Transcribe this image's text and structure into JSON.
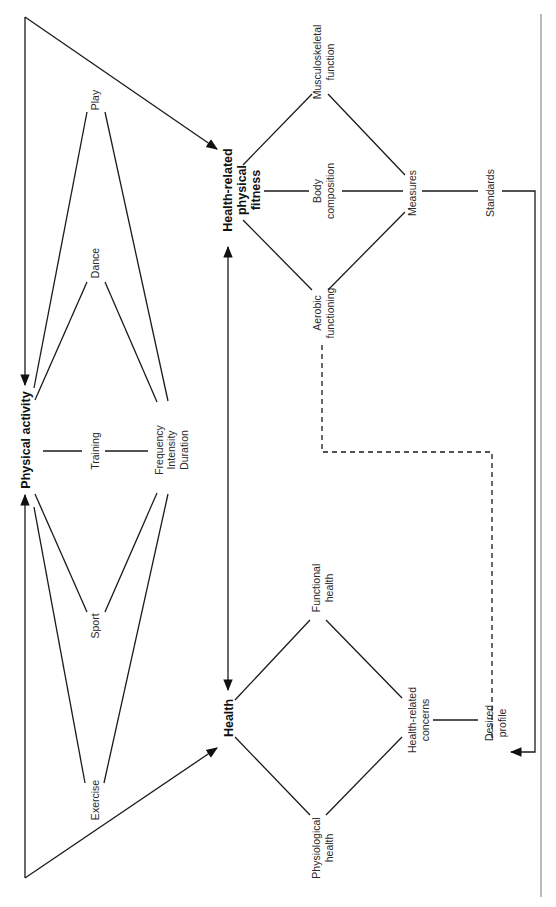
{
  "diagram": {
    "orientation": "rotated-90-ccw",
    "nodes": {
      "physical_activity": "Physical activity",
      "health_fitness": [
        "Health-related",
        "physical",
        "fitness"
      ],
      "health": "Health",
      "play": "Play",
      "dance": "Dance",
      "training": "Training",
      "sport": "Sport",
      "exercise": "Exercise",
      "fid": [
        "Frequency",
        "Intensity",
        "Duration"
      ],
      "musculoskeletal": [
        "Musculoskeletal",
        "function"
      ],
      "body_composition": [
        "Body",
        "composition"
      ],
      "aerobic": [
        "Aerobic",
        "functioning"
      ],
      "measures": "Measures",
      "standards": "Standards",
      "functional_health": [
        "Functional",
        "health"
      ],
      "physiological_health": [
        "Physiological",
        "health"
      ],
      "health_concerns": [
        "Health-related",
        "concerns"
      ],
      "desired_profile": [
        "Desired",
        "profile"
      ]
    },
    "edges": [
      {
        "from": "Physical activity",
        "to": "Health-related physical fitness",
        "type": "arrow"
      },
      {
        "from": "Physical activity",
        "to": "Health",
        "type": "arrow"
      },
      {
        "from": "Health-related physical fitness",
        "to": "Physical activity",
        "type": "arrow"
      },
      {
        "from": "Health",
        "to": "Physical activity",
        "type": "arrow"
      },
      {
        "from": "Health",
        "to": "Health-related physical fitness",
        "type": "double-arrow"
      },
      {
        "from": "Physical activity",
        "to": "Play",
        "type": "line"
      },
      {
        "from": "Physical activity",
        "to": "Dance",
        "type": "line"
      },
      {
        "from": "Physical activity",
        "to": "Training",
        "type": "line"
      },
      {
        "from": "Physical activity",
        "to": "Sport",
        "type": "line"
      },
      {
        "from": "Physical activity",
        "to": "Exercise",
        "type": "line"
      },
      {
        "from": "Frequency/Intensity/Duration",
        "to": "Play",
        "type": "line"
      },
      {
        "from": "Frequency/Intensity/Duration",
        "to": "Dance",
        "type": "line"
      },
      {
        "from": "Frequency/Intensity/Duration",
        "to": "Training",
        "type": "line"
      },
      {
        "from": "Frequency/Intensity/Duration",
        "to": "Sport",
        "type": "line"
      },
      {
        "from": "Frequency/Intensity/Duration",
        "to": "Exercise",
        "type": "line"
      },
      {
        "from": "Health-related physical fitness",
        "to": "Musculoskeletal function",
        "type": "line"
      },
      {
        "from": "Health-related physical fitness",
        "to": "Body composition",
        "type": "line"
      },
      {
        "from": "Health-related physical fitness",
        "to": "Aerobic functioning",
        "type": "line"
      },
      {
        "from": "Musculoskeletal function",
        "to": "Measures",
        "type": "line"
      },
      {
        "from": "Body composition",
        "to": "Measures",
        "type": "line"
      },
      {
        "from": "Aerobic functioning",
        "to": "Measures",
        "type": "line"
      },
      {
        "from": "Measures",
        "to": "Standards",
        "type": "line"
      },
      {
        "from": "Standards",
        "to": "Desired profile",
        "type": "arrow"
      },
      {
        "from": "Health",
        "to": "Functional health",
        "type": "line"
      },
      {
        "from": "Health",
        "to": "Physiological health",
        "type": "line"
      },
      {
        "from": "Functional health",
        "to": "Health-related concerns",
        "type": "line"
      },
      {
        "from": "Physiological health",
        "to": "Health-related concerns",
        "type": "line"
      },
      {
        "from": "Health-related concerns",
        "to": "Desired profile",
        "type": "line"
      },
      {
        "from": "Aerobic functioning",
        "to": "Desired profile",
        "type": "dashed"
      }
    ]
  }
}
